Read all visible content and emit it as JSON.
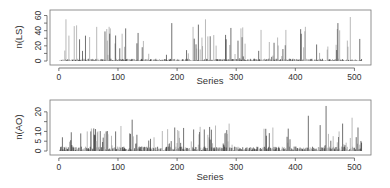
{
  "chart_data": [
    {
      "type": "bar",
      "style": "spike",
      "title": "",
      "xlabel": "Series",
      "ylabel": "n(LS)",
      "xlim": [
        0,
        520
      ],
      "ylim": [
        0,
        62
      ],
      "xticks": [
        0,
        100,
        200,
        300,
        400,
        500
      ],
      "yticks": [
        0,
        20,
        40,
        60
      ],
      "yticks_minor": [
        10,
        30,
        50
      ],
      "n_series": 512,
      "seed": 17,
      "baseline_level": 2,
      "peaks": [
        {
          "x": 12,
          "y": 55
        },
        {
          "x": 26,
          "y": 46
        },
        {
          "x": 30,
          "y": 47
        },
        {
          "x": 64,
          "y": 45
        },
        {
          "x": 78,
          "y": 39
        },
        {
          "x": 107,
          "y": 36
        },
        {
          "x": 113,
          "y": 43
        },
        {
          "x": 134,
          "y": 37
        },
        {
          "x": 191,
          "y": 50
        },
        {
          "x": 227,
          "y": 45
        },
        {
          "x": 236,
          "y": 48
        },
        {
          "x": 248,
          "y": 55
        },
        {
          "x": 308,
          "y": 43
        },
        {
          "x": 342,
          "y": 41
        },
        {
          "x": 384,
          "y": 41
        },
        {
          "x": 409,
          "y": 42
        },
        {
          "x": 472,
          "y": 50
        },
        {
          "x": 493,
          "y": 58
        }
      ],
      "grid": false,
      "legend": null
    },
    {
      "type": "bar",
      "style": "spike",
      "title": "",
      "xlabel": "Series",
      "ylabel": "n(AO)",
      "xlim": [
        0,
        520
      ],
      "ylim": [
        0,
        24
      ],
      "xticks": [
        0,
        100,
        200,
        300,
        400,
        500
      ],
      "yticks": [
        0,
        5,
        10,
        20
      ],
      "yticks_minor": [
        15
      ],
      "n_series": 512,
      "seed": 41,
      "baseline_level": 1.5,
      "peaks": [
        {
          "x": 6,
          "y": 7
        },
        {
          "x": 48,
          "y": 10
        },
        {
          "x": 54,
          "y": 10
        },
        {
          "x": 80,
          "y": 10
        },
        {
          "x": 96,
          "y": 10
        },
        {
          "x": 120,
          "y": 9
        },
        {
          "x": 124,
          "y": 16
        },
        {
          "x": 196,
          "y": 12
        },
        {
          "x": 228,
          "y": 11
        },
        {
          "x": 246,
          "y": 11
        },
        {
          "x": 288,
          "y": 14
        },
        {
          "x": 362,
          "y": 12
        },
        {
          "x": 422,
          "y": 18
        },
        {
          "x": 452,
          "y": 23
        },
        {
          "x": 480,
          "y": 14
        },
        {
          "x": 496,
          "y": 17
        },
        {
          "x": 506,
          "y": 12
        }
      ],
      "grid": false,
      "legend": null
    }
  ],
  "panels": [
    {
      "ylabel": "n(LS)",
      "xlabel": "Series",
      "xtick_labels": [
        "0",
        "100",
        "200",
        "300",
        "400",
        "500"
      ],
      "ytick_labels": [
        "0",
        "20",
        "40",
        "60"
      ]
    },
    {
      "ylabel": "n(AO)",
      "xlabel": "Series",
      "xtick_labels": [
        "0",
        "100",
        "200",
        "300",
        "400",
        "500"
      ],
      "ytick_labels": [
        "0",
        "5",
        "10",
        "20"
      ]
    }
  ],
  "colors": {
    "spike_dark": "#111111",
    "spike_light": "#8a8a8a",
    "axis": "#555555",
    "frame": "#777777"
  }
}
